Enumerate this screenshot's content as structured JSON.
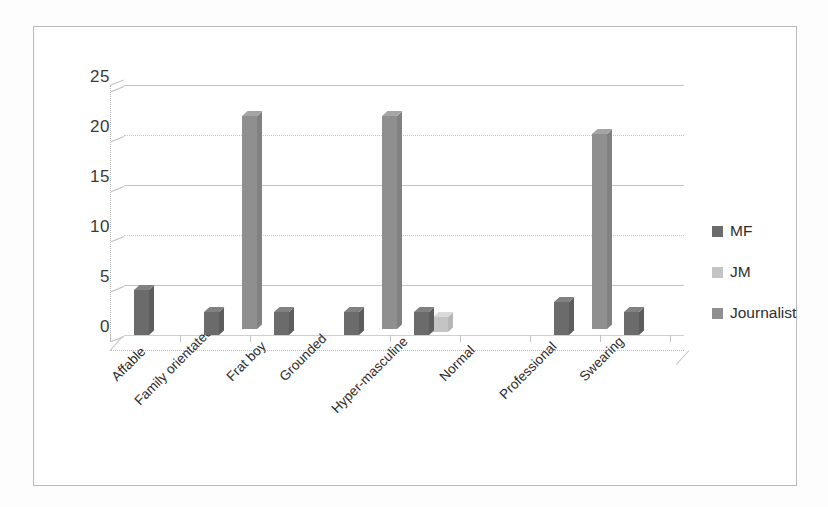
{
  "chart_data": {
    "type": "bar",
    "title": "",
    "subtitle": "",
    "xlabel": "",
    "ylabel": "",
    "ylim": [
      0,
      25
    ],
    "yticks": [
      "0",
      "5",
      "10",
      "15",
      "20",
      "25"
    ],
    "grid": true,
    "legend_position": "right",
    "style_note": "3-D clustered column chart, grayscale scanned figure",
    "categories": [
      "Affable",
      "Family orientated",
      "Frat boy",
      "Grounded",
      "Hyper-masculine",
      "Normal",
      "Professional",
      "Swearing"
    ],
    "series": [
      {
        "name": "MF",
        "color": "#6b6b6b",
        "values": [
          4.5,
          2.3,
          2.3,
          2.3,
          2.3,
          0,
          3.3,
          2.3
        ]
      },
      {
        "name": "JM",
        "color": "#c4c4c4",
        "values": [
          0,
          0,
          0,
          0,
          1.5,
          0,
          0,
          0
        ]
      },
      {
        "name": "Journalist",
        "color": "#8f8f8f",
        "values": [
          0,
          21.3,
          0,
          21.3,
          0,
          0,
          19.5,
          0
        ]
      }
    ]
  },
  "legend": {
    "items": [
      {
        "label": "MF"
      },
      {
        "label": "JM"
      },
      {
        "label": "Journalist"
      }
    ]
  },
  "colors": {
    "mf": "#6b6b6b",
    "jm": "#c4c4c4",
    "journalist": "#8f8f8f",
    "gridline": "#c2c2c2",
    "frame": "#b9b9b9",
    "text": "#2b2b2b",
    "background": "#ffffff"
  }
}
